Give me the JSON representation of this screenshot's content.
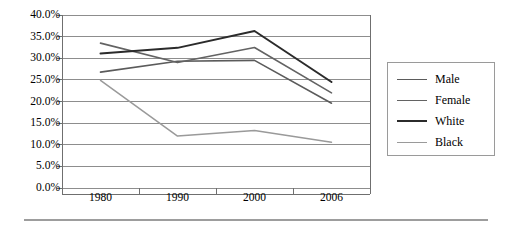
{
  "chart_data": {
    "type": "line",
    "title": "",
    "xlabel": "",
    "ylabel": "",
    "categories": [
      "1980",
      "1990",
      "2000",
      "2006"
    ],
    "ylim": [
      0,
      40
    ],
    "ytick_labels": [
      "0.0%",
      "5.0%",
      "10.0%",
      "15.0%",
      "20.0%",
      "25.0%",
      "30.0%",
      "35.0%",
      "40.0%"
    ],
    "ytick_values": [
      0,
      5,
      10,
      15,
      20,
      25,
      30,
      35,
      40
    ],
    "grid": true,
    "legend_position": "right",
    "series": [
      {
        "name": "Male",
        "color": "#5b5b5b",
        "width": 1.6,
        "values": [
          26.8,
          29.3,
          29.5,
          19.6
        ]
      },
      {
        "name": "Female",
        "color": "#636363",
        "width": 1.6,
        "values": [
          33.5,
          29.0,
          32.5,
          22.0
        ]
      },
      {
        "name": "White",
        "color": "#2b2b2b",
        "width": 2.0,
        "values": [
          31.1,
          32.4,
          36.3,
          24.5
        ]
      },
      {
        "name": "Black",
        "color": "#9a9a9a",
        "width": 1.5,
        "values": [
          24.9,
          12.0,
          13.3,
          10.6
        ]
      }
    ]
  },
  "legend": {
    "entries": [
      "Male",
      "Female",
      "White",
      "Black"
    ]
  },
  "axis": {
    "frame_color": "#6f6f6f",
    "grid_color": "#8d8d8d"
  }
}
